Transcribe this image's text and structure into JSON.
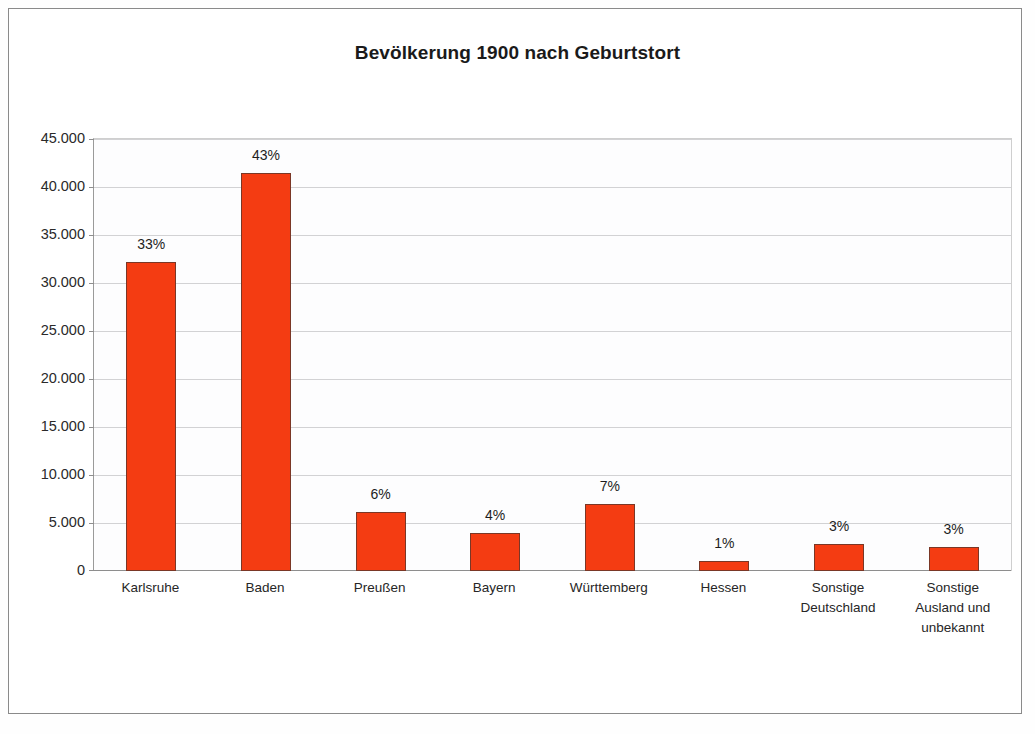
{
  "figure": {
    "title": "Bevölkerung 1900 nach Geburtstort",
    "bar_color": "#f43c12",
    "bar_border_color": "#7a3726",
    "grid_color": "#d2d2d4",
    "axis_color": "#8e8e8e",
    "frame_color": "#8a8a8a",
    "plot_background": "#fdfdfe"
  },
  "chart_data": {
    "type": "bar",
    "title": "Bevölkerung 1900 nach Geburtstort",
    "xlabel": "",
    "ylabel": "",
    "ylim": [
      0,
      45000
    ],
    "grid": true,
    "legend": "none",
    "categories": [
      "Karlsruhe",
      "Baden",
      "Preußen",
      "Bayern",
      "Württemberg",
      "Hessen",
      "Sonstige Deutschland",
      "Sonstige Ausland und unbekannt"
    ],
    "category_lines": [
      [
        "Karlsruhe"
      ],
      [
        "Baden"
      ],
      [
        "Preußen"
      ],
      [
        "Bayern"
      ],
      [
        "Württemberg"
      ],
      [
        "Hessen"
      ],
      [
        "Sonstige",
        "Deutschland"
      ],
      [
        "Sonstige",
        "Ausland und",
        "unbekannt"
      ]
    ],
    "values": [
      32150,
      41500,
      6150,
      4000,
      7000,
      1000,
      2800,
      2550
    ],
    "data_labels": [
      "33%",
      "43%",
      "6%",
      "4%",
      "7%",
      "1%",
      "3%",
      "3%"
    ],
    "ytick_values": [
      0,
      5000,
      10000,
      15000,
      20000,
      25000,
      30000,
      35000,
      40000,
      45000
    ],
    "ytick_labels": [
      "0",
      "5.000",
      "10.000",
      "15.000",
      "20.000",
      "25.000",
      "30.000",
      "35.000",
      "40.000",
      "45.000"
    ]
  }
}
